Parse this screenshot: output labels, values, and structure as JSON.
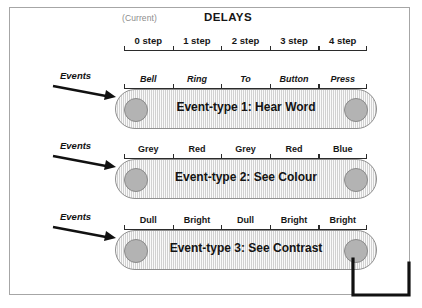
{
  "header": {
    "current_label": "(Current)",
    "title": "DELAYS",
    "delay_ticks": [
      "0 step",
      "1 step",
      "2 step",
      "3 step",
      "4 step"
    ]
  },
  "events_label": "Events",
  "rows": [
    {
      "name": "event-type-1",
      "belt_label": "Event-type 1: Hear Word",
      "italic_labels": true,
      "labels": [
        "Bell",
        "Ring",
        "To",
        "Button",
        "Press"
      ]
    },
    {
      "name": "event-type-2",
      "belt_label": "Event-type 2: See Colour",
      "italic_labels": false,
      "labels": [
        "Grey",
        "Red",
        "Grey",
        "Red",
        "Blue"
      ]
    },
    {
      "name": "event-type-3",
      "belt_label": "Event-type 3: See Contrast",
      "italic_labels": false,
      "labels": [
        "Dull",
        "Bright",
        "Dull",
        "Bright",
        "Bright"
      ]
    }
  ],
  "colors": {
    "frame_border": "#a6a6a6",
    "belt_fill": "#dcdcdc",
    "belt_border": "#8f8f8f",
    "pulley_fill": "#b3b3b3",
    "ink": "#161616",
    "muted": "#8c8c8c"
  }
}
